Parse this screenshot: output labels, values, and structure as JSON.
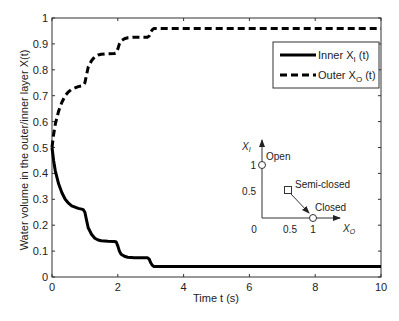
{
  "chart_data": {
    "type": "line",
    "title": "",
    "xlabel": "Time t (s)",
    "ylabel": "Water volume in the outer/inner layer X(t)",
    "xlim": [
      0,
      10
    ],
    "ylim": [
      0,
      1
    ],
    "xticks": [
      "0",
      "2",
      "4",
      "6",
      "8",
      "10"
    ],
    "xtick_values": [
      0,
      2,
      4,
      6,
      8,
      10
    ],
    "yticks": [
      "0",
      "0.1",
      "0.2",
      "0.3",
      "0.4",
      "0.5",
      "0.6",
      "0.7",
      "0.8",
      "0.9",
      "1"
    ],
    "ytick_values": [
      0,
      0.1,
      0.2,
      0.3,
      0.4,
      0.5,
      0.6,
      0.7,
      0.8,
      0.9,
      1.0
    ],
    "grid": false,
    "legend_position": "top-right",
    "series": [
      {
        "name": "Inner X_I (t)",
        "label_main": "Inner  X",
        "label_sub": "I",
        "label_tail": " (t)",
        "style": "solid",
        "color": "#000000",
        "x": [
          0,
          0.05,
          0.1,
          0.2,
          0.3,
          0.4,
          0.5,
          0.6,
          0.7,
          0.8,
          0.9,
          0.95,
          1.0,
          1.05,
          1.1,
          1.2,
          1.3,
          1.4,
          1.5,
          1.7,
          1.9,
          1.95,
          2.0,
          2.05,
          2.1,
          2.2,
          2.3,
          2.5,
          2.9,
          2.95,
          3.0,
          3.05,
          3.1,
          3.2,
          4,
          6,
          8,
          10
        ],
        "y": [
          0.5,
          0.45,
          0.41,
          0.36,
          0.325,
          0.3,
          0.285,
          0.275,
          0.27,
          0.265,
          0.262,
          0.26,
          0.25,
          0.22,
          0.19,
          0.165,
          0.15,
          0.143,
          0.14,
          0.138,
          0.137,
          0.135,
          0.12,
          0.1,
          0.088,
          0.08,
          0.076,
          0.074,
          0.074,
          0.07,
          0.055,
          0.045,
          0.04,
          0.04,
          0.04,
          0.04,
          0.04,
          0.04
        ]
      },
      {
        "name": "Outer X_O (t)",
        "label_main": "Outer X",
        "label_sub": "O",
        "label_tail": " (t)",
        "style": "dashed",
        "color": "#000000",
        "x": [
          0,
          0.05,
          0.1,
          0.2,
          0.3,
          0.4,
          0.5,
          0.6,
          0.7,
          0.8,
          0.9,
          0.95,
          1.0,
          1.05,
          1.1,
          1.2,
          1.3,
          1.4,
          1.5,
          1.7,
          1.9,
          1.95,
          2.0,
          2.05,
          2.1,
          2.2,
          2.3,
          2.5,
          2.9,
          2.95,
          3.0,
          3.05,
          3.1,
          3.2,
          4,
          6,
          8,
          10
        ],
        "y": [
          0.5,
          0.55,
          0.59,
          0.64,
          0.675,
          0.7,
          0.715,
          0.725,
          0.73,
          0.735,
          0.738,
          0.74,
          0.75,
          0.78,
          0.81,
          0.835,
          0.85,
          0.857,
          0.86,
          0.862,
          0.863,
          0.865,
          0.88,
          0.9,
          0.912,
          0.92,
          0.924,
          0.926,
          0.926,
          0.93,
          0.945,
          0.955,
          0.96,
          0.96,
          0.96,
          0.96,
          0.96,
          0.96
        ]
      }
    ],
    "inset": {
      "xlabel_main": "X",
      "xlabel_sub": "O",
      "ylabel_main": "X",
      "ylabel_sub": "I",
      "xticks": [
        "0.5",
        "1"
      ],
      "yticks": [
        "1",
        "0.5"
      ],
      "origin_label": "0",
      "points": [
        {
          "name": "Open",
          "xo": 0,
          "xi": 1,
          "marker": "circle"
        },
        {
          "name": "Semi-closed",
          "xo": 0.5,
          "xi": 0.5,
          "marker": "square"
        },
        {
          "name": "Closed",
          "xo": 1,
          "xi": 0,
          "marker": "circle"
        }
      ],
      "arrow": {
        "from": "Semi-closed",
        "to": "Closed"
      }
    }
  }
}
